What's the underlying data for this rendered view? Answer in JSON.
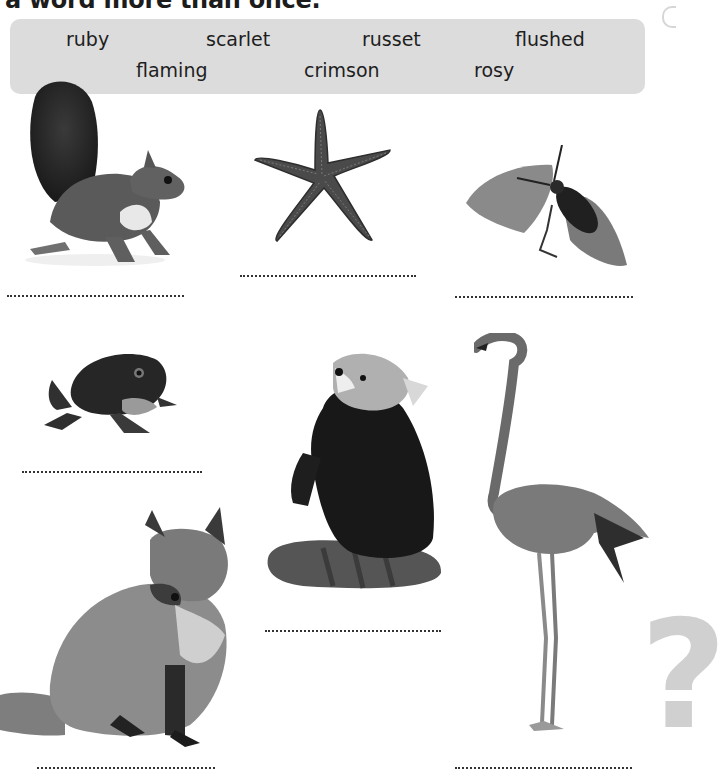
{
  "heading": "a word more than once.",
  "word_bank": {
    "row1": [
      "ruby",
      "scarlet",
      "russet",
      "flushed"
    ],
    "row2": [
      "flaming",
      "crimson",
      "rosy"
    ]
  },
  "animals": [
    {
      "name": "squirrel",
      "answer": ""
    },
    {
      "name": "starfish",
      "answer": ""
    },
    {
      "name": "beetle",
      "answer": ""
    },
    {
      "name": "frog",
      "answer": ""
    },
    {
      "name": "red-panda",
      "answer": ""
    },
    {
      "name": "flamingo",
      "answer": ""
    },
    {
      "name": "fox",
      "answer": ""
    }
  ],
  "decoration": {
    "question_mark": "?"
  },
  "colors": {
    "word_box_bg": "#dcdcdc",
    "text": "#1e1e1e"
  }
}
